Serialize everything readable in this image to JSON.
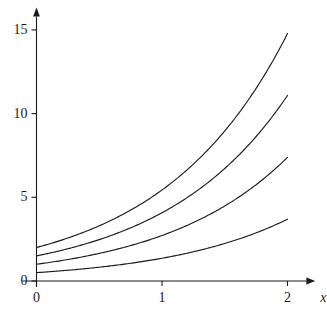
{
  "chart_data": {
    "type": "line",
    "title": "",
    "subtitle": "",
    "xlabel": "x",
    "ylabel": "",
    "xlim": [
      0,
      2.15
    ],
    "ylim": [
      0,
      15.8
    ],
    "grid": false,
    "legend": "none",
    "annotations": [],
    "x_ticks": [
      {
        "value": 0,
        "label": "0"
      },
      {
        "value": 1,
        "label": "1"
      },
      {
        "value": 2,
        "label": "2"
      }
    ],
    "y_ticks": [
      {
        "value": 0,
        "label": "0"
      },
      {
        "value": 5,
        "label": "5"
      },
      {
        "value": 10,
        "label": "10"
      },
      {
        "value": 15,
        "label": "15"
      }
    ],
    "axis_style": {
      "x_axis_arrow": true,
      "y_axis_arrow": true,
      "color": "#1a1a1a",
      "line_width": 1
    },
    "series": [
      {
        "name": "2e^x",
        "coefficient": 2,
        "y_intercept": 2,
        "y_at_x2": 14.78,
        "color": "#1a1a1a",
        "x": [
          0,
          0.2,
          0.4,
          0.6,
          0.8,
          1,
          1.2,
          1.4,
          1.6,
          1.8,
          2
        ],
        "values": [
          2,
          2.44,
          2.98,
          3.64,
          4.45,
          5.44,
          6.64,
          8.11,
          9.91,
          12.1,
          14.78
        ]
      },
      {
        "name": "1.5e^x",
        "coefficient": 1.5,
        "y_intercept": 1.5,
        "y_at_x2": 11.08,
        "color": "#1a1a1a",
        "x": [
          0,
          0.2,
          0.4,
          0.6,
          0.8,
          1,
          1.2,
          1.4,
          1.6,
          1.8,
          2
        ],
        "values": [
          1.5,
          1.83,
          2.24,
          2.73,
          3.34,
          4.08,
          4.98,
          6.08,
          7.43,
          9.07,
          11.08
        ]
      },
      {
        "name": "1e^x",
        "coefficient": 1,
        "y_intercept": 1,
        "y_at_x2": 7.39,
        "color": "#1a1a1a",
        "x": [
          0,
          0.2,
          0.4,
          0.6,
          0.8,
          1,
          1.2,
          1.4,
          1.6,
          1.8,
          2
        ],
        "values": [
          1,
          1.22,
          1.49,
          1.82,
          2.23,
          2.72,
          3.32,
          4.06,
          4.95,
          6.05,
          7.39
        ]
      },
      {
        "name": "0.5e^x",
        "coefficient": 0.5,
        "y_intercept": 0.5,
        "y_at_x2": 3.69,
        "color": "#1a1a1a",
        "x": [
          0,
          0.2,
          0.4,
          0.6,
          0.8,
          1,
          1.2,
          1.4,
          1.6,
          1.8,
          2
        ],
        "values": [
          0.5,
          0.61,
          0.75,
          0.91,
          1.11,
          1.36,
          1.66,
          2.03,
          2.48,
          3.02,
          3.69
        ]
      }
    ]
  },
  "axis_labels": {
    "x_axis_name": "x"
  }
}
